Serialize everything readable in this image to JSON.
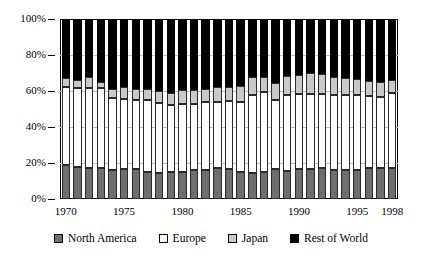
{
  "chart_data": {
    "type": "bar",
    "subtype": "100% stacked column",
    "title": "",
    "subtitle": "",
    "xlabel": "",
    "ylabel": "",
    "ylim": [
      0,
      100
    ],
    "yticks": [
      0,
      20,
      40,
      60,
      80,
      100
    ],
    "ytick_labels": [
      "0%",
      "20%",
      "40%",
      "60%",
      "80%",
      "100%"
    ],
    "grid": true,
    "legend_position": "bottom",
    "categories": [
      "1970",
      "1971",
      "1972",
      "1973",
      "1974",
      "1975",
      "1976",
      "1977",
      "1978",
      "1979",
      "1980",
      "1981",
      "1982",
      "1983",
      "1984",
      "1985",
      "1986",
      "1987",
      "1988",
      "1989",
      "1990",
      "1991",
      "1992",
      "1993",
      "1994",
      "1995",
      "1996",
      "1997",
      "1998"
    ],
    "xtick_labels": [
      "1970",
      "1975",
      "1980",
      "1985",
      "1990",
      "1995",
      "1998"
    ],
    "xtick_categories": [
      "1970",
      "1975",
      "1980",
      "1985",
      "1990",
      "1995",
      "1998"
    ],
    "series": [
      {
        "name": "North America",
        "color": "#6e6e6e",
        "values": [
          19,
          18,
          17.5,
          17,
          16,
          16.5,
          16.5,
          15,
          14.5,
          15,
          15,
          16,
          16,
          17,
          16.5,
          15,
          14.5,
          15,
          16.5,
          15.5,
          16.5,
          16.5,
          17,
          16,
          16,
          16,
          17.5,
          17.5,
          17.5
        ]
      },
      {
        "name": "Europe",
        "color": "#ffffff",
        "values": [
          43.5,
          43.5,
          44,
          44.5,
          40,
          39,
          38.5,
          40,
          39,
          37.5,
          38,
          37,
          38,
          37,
          38,
          39,
          43.5,
          44.5,
          38.5,
          42.5,
          42,
          42,
          41.5,
          42,
          42,
          42,
          39.5,
          39,
          41.5
        ]
      },
      {
        "name": "Japan",
        "color": "#c9c9c9",
        "values": [
          5,
          4.5,
          6.5,
          3.5,
          5,
          6.5,
          6,
          6,
          6.5,
          6.5,
          7.5,
          7.5,
          7,
          8,
          8,
          9,
          10,
          8.5,
          9.5,
          10.5,
          10.5,
          11.5,
          11,
          10,
          9.5,
          8.5,
          8.5,
          8.5,
          7
        ]
      },
      {
        "name": "Rest of World",
        "color": "#000000",
        "values": [
          32.5,
          34,
          32,
          35,
          39,
          38,
          39,
          39,
          40,
          41,
          39.5,
          39.5,
          39,
          38,
          37.5,
          37,
          32,
          32,
          35.5,
          31.5,
          31,
          30,
          30.5,
          32,
          32.5,
          33.5,
          34.5,
          35,
          34
        ]
      }
    ]
  },
  "legend": {
    "items": [
      {
        "label": "North America",
        "swatch": "na"
      },
      {
        "label": "Europe",
        "swatch": "eu"
      },
      {
        "label": "Japan",
        "swatch": "jp"
      },
      {
        "label": "Rest of World",
        "swatch": "row"
      }
    ]
  }
}
